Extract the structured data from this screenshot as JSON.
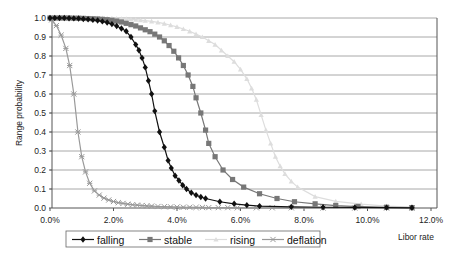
{
  "chart_data": {
    "type": "line",
    "title": "",
    "xlabel": "Libor rate",
    "ylabel": "Range probability",
    "xlim": [
      0,
      12
    ],
    "ylim": [
      0,
      1
    ],
    "x_ticks": [
      "0.0%",
      "2.0%",
      "4.0%",
      "6.0%",
      "8.0%",
      "10.0%",
      "12.0%"
    ],
    "x_tick_values": [
      0,
      2,
      4,
      6,
      8,
      10,
      12
    ],
    "y_ticks": [
      "0.0",
      "0.1",
      "0.2",
      "0.3",
      "0.4",
      "0.5",
      "0.6",
      "0.7",
      "0.8",
      "0.9",
      "1.0"
    ],
    "y_tick_values": [
      0,
      0.1,
      0.2,
      0.3,
      0.4,
      0.5,
      0.6,
      0.7,
      0.8,
      0.9,
      1.0
    ],
    "grid": "horizontal",
    "legend_position": "bottom",
    "series": [
      {
        "name": "falling",
        "color": "#111111",
        "marker": "diamond",
        "x": [
          0.0,
          0.15,
          0.3,
          0.45,
          0.6,
          0.75,
          0.9,
          1.05,
          1.2,
          1.35,
          1.5,
          1.65,
          1.8,
          1.95,
          2.1,
          2.25,
          2.4,
          2.55,
          2.7,
          2.8,
          2.9,
          3.0,
          3.1,
          3.2,
          3.3,
          3.45,
          3.6,
          3.72,
          3.82,
          3.94,
          4.06,
          4.18,
          4.3,
          4.45,
          4.6,
          4.75,
          4.9,
          5.35,
          5.8,
          6.2,
          6.6,
          7.6,
          8.6,
          9.6,
          10.6,
          11.4
        ],
        "y": [
          1.0,
          1.0,
          1.0,
          1.0,
          0.999,
          0.998,
          0.997,
          0.995,
          0.993,
          0.99,
          0.987,
          0.982,
          0.976,
          0.968,
          0.958,
          0.945,
          0.93,
          0.9,
          0.86,
          0.83,
          0.79,
          0.74,
          0.67,
          0.6,
          0.51,
          0.4,
          0.32,
          0.25,
          0.21,
          0.17,
          0.145,
          0.12,
          0.1,
          0.08,
          0.068,
          0.058,
          0.05,
          0.033,
          0.022,
          0.015,
          0.01,
          0.006,
          0.004,
          0.003,
          0.002,
          0.001
        ]
      },
      {
        "name": "stable",
        "color": "#777777",
        "marker": "square",
        "x": [
          0.0,
          0.15,
          0.3,
          0.45,
          0.6,
          0.75,
          0.9,
          1.05,
          1.2,
          1.35,
          1.5,
          1.65,
          1.8,
          1.95,
          2.1,
          2.25,
          2.4,
          2.55,
          2.7,
          2.85,
          3.0,
          3.15,
          3.3,
          3.45,
          3.6,
          3.75,
          3.9,
          4.05,
          4.2,
          4.35,
          4.5,
          4.6,
          4.75,
          4.9,
          5.0,
          5.2,
          5.45,
          5.75,
          6.1,
          6.6,
          7.15,
          7.7,
          8.35,
          9.0,
          9.7,
          10.6,
          11.4
        ],
        "y": [
          1.0,
          1.0,
          1.0,
          1.0,
          1.0,
          0.999,
          0.999,
          0.998,
          0.997,
          0.996,
          0.995,
          0.993,
          0.991,
          0.988,
          0.984,
          0.979,
          0.972,
          0.965,
          0.958,
          0.948,
          0.938,
          0.928,
          0.915,
          0.9,
          0.88,
          0.855,
          0.825,
          0.79,
          0.75,
          0.7,
          0.64,
          0.58,
          0.5,
          0.41,
          0.34,
          0.27,
          0.2,
          0.15,
          0.11,
          0.075,
          0.05,
          0.033,
          0.022,
          0.013,
          0.008,
          0.004,
          0.002
        ]
      },
      {
        "name": "rising",
        "color": "#dddddd",
        "marker": "triangle",
        "x": [
          0.0,
          0.15,
          0.3,
          0.45,
          0.6,
          0.75,
          0.9,
          1.05,
          1.2,
          1.35,
          1.5,
          1.65,
          1.8,
          1.95,
          2.1,
          2.25,
          2.4,
          2.55,
          2.7,
          2.85,
          3.0,
          3.2,
          3.4,
          3.6,
          3.8,
          4.0,
          4.2,
          4.4,
          4.6,
          4.8,
          5.0,
          5.2,
          5.4,
          5.6,
          5.8,
          6.0,
          6.2,
          6.35,
          6.5,
          6.65,
          6.8,
          6.95,
          7.1,
          7.25,
          7.4,
          7.6,
          7.8,
          8.35,
          9.0,
          9.8,
          10.6,
          11.4
        ],
        "y": [
          1.0,
          1.0,
          1.0,
          1.0,
          1.0,
          1.0,
          1.0,
          1.0,
          1.0,
          0.999,
          0.999,
          0.999,
          0.998,
          0.998,
          0.997,
          0.996,
          0.995,
          0.993,
          0.991,
          0.989,
          0.986,
          0.982,
          0.977,
          0.97,
          0.962,
          0.953,
          0.942,
          0.93,
          0.915,
          0.9,
          0.88,
          0.86,
          0.83,
          0.8,
          0.77,
          0.73,
          0.68,
          0.63,
          0.57,
          0.49,
          0.41,
          0.34,
          0.27,
          0.22,
          0.18,
          0.14,
          0.11,
          0.06,
          0.035,
          0.02,
          0.01,
          0.005
        ]
      },
      {
        "name": "deflation",
        "color": "#999999",
        "marker": "x",
        "x": [
          0.05,
          0.2,
          0.35,
          0.5,
          0.62,
          0.75,
          0.88,
          1.0,
          1.12,
          1.25,
          1.4,
          1.55,
          1.7,
          1.85,
          2.0,
          2.15,
          2.3,
          2.45,
          2.6,
          2.75,
          2.9,
          3.05,
          3.2,
          3.4,
          3.6,
          3.8,
          4.0,
          4.2,
          4.4,
          4.6,
          4.8,
          5.0,
          5.3,
          5.6,
          5.9,
          6.5,
          7.0,
          7.6,
          8.6,
          9.6,
          10.6,
          11.4
        ],
        "y": [
          0.99,
          0.96,
          0.91,
          0.84,
          0.75,
          0.6,
          0.4,
          0.27,
          0.19,
          0.13,
          0.09,
          0.068,
          0.052,
          0.042,
          0.034,
          0.028,
          0.024,
          0.02,
          0.017,
          0.015,
          0.013,
          0.011,
          0.01,
          0.008,
          0.007,
          0.006,
          0.005,
          0.004,
          0.004,
          0.003,
          0.003,
          0.002,
          0.002,
          0.002,
          0.001,
          0.001,
          0.001,
          0.001,
          0.0,
          0.0,
          0.0,
          0.0
        ]
      }
    ]
  },
  "legend": {
    "items": [
      {
        "label": "falling"
      },
      {
        "label": "stable"
      },
      {
        "label": "rising"
      },
      {
        "label": "deflation"
      }
    ]
  }
}
